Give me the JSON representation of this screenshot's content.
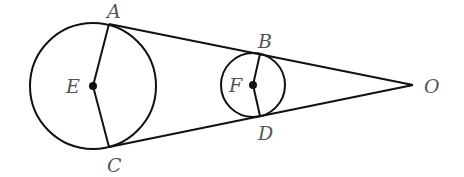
{
  "diagram": {
    "circles": [
      {
        "name": "E",
        "center": [
          93,
          86
        ],
        "radius": 63
      },
      {
        "name": "F",
        "center": [
          253,
          85
        ],
        "radius": 32
      }
    ],
    "points": {
      "A": {
        "label": "A",
        "pos": [
          109,
          24
        ],
        "label_pos": [
          107,
          18
        ]
      },
      "C": {
        "label": "C",
        "pos": [
          109,
          147
        ],
        "label_pos": [
          107,
          172
        ]
      },
      "B": {
        "label": "B",
        "pos": [
          260,
          54
        ],
        "label_pos": [
          258,
          48
        ]
      },
      "D": {
        "label": "D",
        "pos": [
          260,
          116
        ],
        "label_pos": [
          258,
          140
        ]
      },
      "E": {
        "label": "E",
        "pos": [
          93,
          86
        ],
        "label_pos": [
          68,
          93
        ]
      },
      "F": {
        "label": "F",
        "pos": [
          253,
          85
        ],
        "label_pos": [
          230,
          92
        ]
      },
      "O": {
        "label": "O",
        "pos": [
          413,
          85
        ],
        "label_pos": [
          425,
          93
        ]
      }
    },
    "segments": [
      [
        "A",
        "O"
      ],
      [
        "C",
        "O"
      ],
      [
        "E",
        "A"
      ],
      [
        "E",
        "C"
      ],
      [
        "F",
        "B"
      ],
      [
        "F",
        "D"
      ]
    ],
    "colors": {
      "line": "#111111",
      "label": "#555555",
      "background": "#ffffff"
    }
  }
}
